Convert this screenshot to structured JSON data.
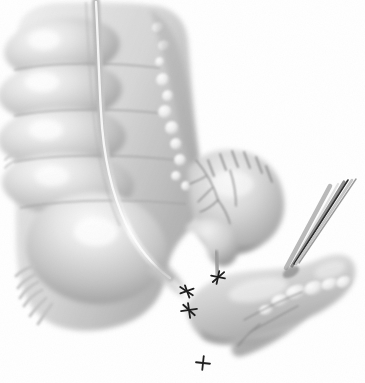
{
  "document": {
    "type": "medical-illustration",
    "title": "Ileocecal resection with specimen held in forceps",
    "medium": "grayscale pencil / airbrush rendering",
    "background_color": "#ffffff",
    "canvas": {
      "width": 365,
      "height": 383
    }
  },
  "palette": {
    "background": "#ffffff",
    "tissue_light": "#e8e8e8",
    "tissue_mid": "#cfcfcf",
    "tissue_dark": "#a8a8a8",
    "shadow": "#8a8a8a",
    "deep_shadow": "#6e6e6e",
    "highlight": "#fafafa",
    "fat_nodule": "#eeeeee",
    "vessel": "#9a9a9a",
    "suture_black": "#1c1c1c",
    "instrument_steel": "#b9b9b9",
    "instrument_dark": "#2a2a2a",
    "outline": "#9d9d9d"
  },
  "structures": {
    "colon": {
      "label": "Ascending colon",
      "haustra_count": 5,
      "haustra": [
        {
          "label": "Haustrum 1",
          "cx": 62,
          "cy": 48,
          "rx": 58,
          "ry": 30,
          "rot": -6,
          "highlight_x": 44,
          "highlight_y": 40
        },
        {
          "label": "Haustrum 2",
          "cx": 60,
          "cy": 92,
          "rx": 62,
          "ry": 30,
          "rot": -4,
          "highlight_x": 42,
          "highlight_y": 82
        },
        {
          "label": "Haustrum 3",
          "cx": 62,
          "cy": 138,
          "rx": 64,
          "ry": 31,
          "rot": -2,
          "highlight_x": 46,
          "highlight_y": 130
        },
        {
          "label": "Haustrum 4",
          "cx": 68,
          "cy": 184,
          "rx": 66,
          "ry": 32,
          "rot": 2,
          "highlight_x": 52,
          "highlight_y": 176
        },
        {
          "label": "Cecum",
          "cx": 96,
          "cy": 248,
          "rx": 70,
          "ry": 56,
          "rot": 6,
          "highlight_x": 96,
          "highlight_y": 232
        }
      ],
      "taenia_coli": {
        "label": "Taenia coli (longitudinal muscle band)",
        "path": "M 96 2 C 98 40 99 80 101 112 C 103 150 110 190 126 224 C 140 252 156 268 170 278"
      },
      "body_outline": "M 18 36 C 16 16 34 4 58 3 C 92 2 132 2 158 6 C 176 10 186 22 188 42 C 192 92 196 140 202 174 C 206 198 200 220 182 238 C 172 250 168 262 166 276 C 162 300 146 318 118 326 C 84 336 52 330 36 312 C 20 294 16 264 16 232 C 16 186 16 120 18 36 Z"
    },
    "epiploic_appendages": {
      "label": "Epiploic appendages (fatty tags)",
      "nodes": [
        {
          "cx": 158,
          "cy": 28,
          "r": 6
        },
        {
          "cx": 164,
          "cy": 46,
          "r": 6
        },
        {
          "cx": 160,
          "cy": 62,
          "r": 5
        },
        {
          "cx": 163,
          "cy": 80,
          "r": 7
        },
        {
          "cx": 168,
          "cy": 96,
          "r": 6
        },
        {
          "cx": 165,
          "cy": 112,
          "r": 7
        },
        {
          "cx": 172,
          "cy": 128,
          "r": 7
        },
        {
          "cx": 176,
          "cy": 144,
          "r": 6
        },
        {
          "cx": 180,
          "cy": 160,
          "r": 6
        },
        {
          "cx": 176,
          "cy": 176,
          "r": 5
        },
        {
          "cx": 186,
          "cy": 186,
          "r": 5
        }
      ]
    },
    "terminal_ileum": {
      "label": "Terminal ileum / ileocecal junction segment",
      "outline": "M 188 168 C 204 150 226 146 246 152 C 268 158 282 176 284 200 C 286 222 274 240 256 248 C 240 256 222 254 210 244 C 198 234 192 216 190 198 C 189 186 188 176 188 168 Z",
      "suture_line": {
        "label": "Serosal suture line (interrupted stitches)",
        "stitches": [
          {
            "x1": 208,
            "y1": 160,
            "x2": 214,
            "y2": 176
          },
          {
            "x1": 220,
            "y1": 154,
            "x2": 226,
            "y2": 170
          },
          {
            "x1": 232,
            "y1": 151,
            "x2": 238,
            "y2": 167
          },
          {
            "x1": 244,
            "y1": 152,
            "x2": 250,
            "y2": 168
          },
          {
            "x1": 256,
            "y1": 157,
            "x2": 262,
            "y2": 173
          },
          {
            "x1": 266,
            "y1": 166,
            "x2": 272,
            "y2": 182
          }
        ]
      }
    },
    "mesentery": {
      "label": "Mesentery with vascular arcade",
      "vessels": [
        "M 196 160 C 206 172 214 186 218 200",
        "M 218 200 C 212 206 206 210 200 212",
        "M 218 200 C 224 208 228 216 230 224",
        "M 206 176 C 200 180 194 182 190 184",
        "M 212 188 C 206 194 202 198 198 202",
        "M 230 170 C 234 182 236 194 236 206"
      ]
    },
    "appendix_stump": {
      "label": "Ligated appendiceal stump",
      "outline": "M 186 226 C 196 218 210 216 222 222 C 234 228 240 240 238 252 C 236 262 228 268 220 266 C 212 264 208 256 206 248 C 204 240 196 232 186 230 Z",
      "stalk": "M 216 252 L 218 276"
    },
    "specimen": {
      "label": "Resected ileocecal specimen held in forceps",
      "outline": "M 186 306 C 196 288 216 276 242 272 C 268 268 292 270 312 262 C 326 256 336 252 346 256 C 356 260 358 272 352 284 C 346 296 330 308 308 318 C 286 328 258 336 236 342 C 218 346 204 342 196 332 C 190 324 186 314 186 306 Z",
      "mesenteric_fat_nodes": [
        {
          "cx": 296,
          "cy": 292,
          "rx": 11,
          "ry": 7,
          "rot": -18
        },
        {
          "cx": 314,
          "cy": 288,
          "rx": 10,
          "ry": 7,
          "rot": -18
        },
        {
          "cx": 330,
          "cy": 284,
          "rx": 9,
          "ry": 6,
          "rot": -18
        },
        {
          "cx": 344,
          "cy": 282,
          "rx": 8,
          "ry": 6,
          "rot": -18
        },
        {
          "cx": 280,
          "cy": 300,
          "rx": 9,
          "ry": 6,
          "rot": -16
        },
        {
          "cx": 266,
          "cy": 310,
          "rx": 7,
          "ry": 5,
          "rot": -12
        }
      ],
      "mesentery_flap": "M 236 340 C 252 330 272 318 292 308 C 300 304 306 304 308 308 C 310 314 304 322 292 330 C 276 342 256 352 242 356 C 234 358 230 352 232 346 Z",
      "vessel_lines": [
        "M 244 320 C 262 310 282 300 302 292",
        "M 250 332 C 266 324 282 314 298 306",
        "M 238 346 C 244 338 252 330 260 324"
      ]
    },
    "instrument": {
      "label": "Surgical forceps (Babcock / tissue clamp)",
      "name_icon": "forceps-icon",
      "shafts": [
        {
          "label": "outer jaw",
          "x1": 286,
          "y1": 268,
          "x2": 330,
          "y2": 186,
          "width": 4.5,
          "fill": "#b9b9b9"
        },
        {
          "label": "mid jaw highlight",
          "x1": 290,
          "y1": 268,
          "x2": 338,
          "y2": 184,
          "width": 2.2,
          "fill": "#e2e2e2"
        },
        {
          "label": "inner jaw",
          "x1": 292,
          "y1": 266,
          "x2": 344,
          "y2": 182,
          "width": 3.2,
          "fill": "#8e8e8e"
        },
        {
          "label": "dark edge",
          "x1": 294,
          "y1": 264,
          "x2": 348,
          "y2": 180,
          "width": 1.6,
          "fill": "#2a2a2a"
        },
        {
          "label": "outer edge",
          "x1": 296,
          "y1": 264,
          "x2": 352,
          "y2": 180,
          "width": 2.6,
          "fill": "#c6c6c6"
        }
      ],
      "tip_x": 290,
      "tip_y": 270
    },
    "ligatures": {
      "label": "Suture ties / ligature knots",
      "knots": [
        {
          "label": "appendiceal stump tie",
          "x": 187,
          "y": 291,
          "rot": -20,
          "scale": 1.0
        },
        {
          "label": "ileal stump tie",
          "x": 218,
          "y": 277,
          "rot": 12,
          "scale": 0.95
        },
        {
          "label": "specimen proximal tie",
          "x": 189,
          "y": 310,
          "rot": -8,
          "scale": 1.05
        },
        {
          "label": "specimen mesenteric tie",
          "x": 203,
          "y": 363,
          "rot": 6,
          "scale": 1.0
        }
      ]
    },
    "cut_fringe": {
      "label": "Cut mesenteric fringe (lower left)",
      "strands": [
        "M 34 266 C 26 268 20 272 16 276",
        "M 36 274 C 28 278 22 282 18 288",
        "M 38 282 C 30 286 24 292 20 298",
        "M 42 290 C 34 294 28 300 24 306",
        "M 46 298 C 40 304 34 310 30 316",
        "M 52 304 C 46 312 42 318 38 324"
      ]
    }
  }
}
